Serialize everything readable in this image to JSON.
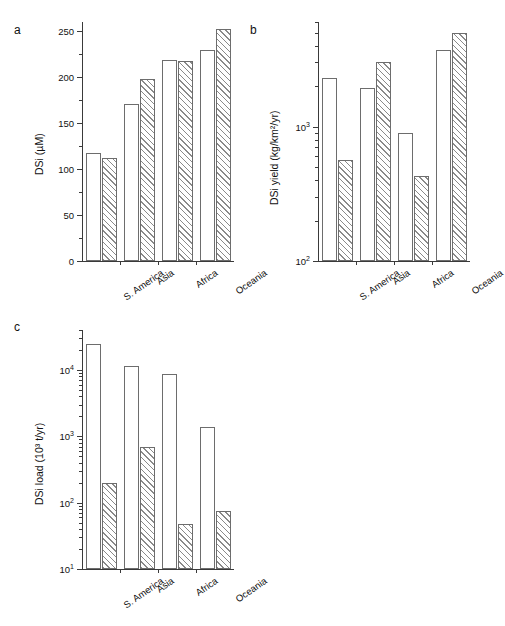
{
  "figure": {
    "categories": [
      "S. America",
      "Asia",
      "Africa",
      "Oceania"
    ],
    "series_names": [
      "open",
      "hatched"
    ],
    "panels": [
      {
        "letter": "a"
      },
      {
        "letter": "b"
      },
      {
        "letter": "c"
      }
    ]
  },
  "chart_data": [
    {
      "type": "bar",
      "panel": "a",
      "title": "",
      "xlabel": "",
      "ylabel": "DSi (µM)",
      "yscale": "linear",
      "ylim": [
        0,
        260
      ],
      "yticks": [
        0,
        50,
        100,
        150,
        200,
        250
      ],
      "yticklabels": [
        "0",
        "50",
        "100",
        "150",
        "200",
        "250"
      ],
      "categories": [
        "S. America",
        "Asia",
        "Africa",
        "Oceania"
      ],
      "grid": false,
      "legend": "none",
      "series": [
        {
          "name": "open",
          "values": [
            117,
            171,
            219,
            230
          ]
        },
        {
          "name": "hatched",
          "values": [
            112,
            198,
            218,
            252
          ]
        }
      ]
    },
    {
      "type": "bar",
      "panel": "b",
      "title": "",
      "xlabel": "",
      "ylabel": "DSi yield (kg/km²/yr)",
      "yscale": "log",
      "ylim": [
        100,
        6000
      ],
      "yticks": [
        100,
        1000
      ],
      "yticklabels": [
        "10²",
        "10³"
      ],
      "categories": [
        "S. America",
        "Asia",
        "Africa",
        "Oceania"
      ],
      "grid": false,
      "legend": "none",
      "series": [
        {
          "name": "open",
          "values": [
            2300,
            1950,
            900,
            3700
          ]
        },
        {
          "name": "hatched",
          "values": [
            560,
            3000,
            430,
            5000
          ]
        }
      ]
    },
    {
      "type": "bar",
      "panel": "c",
      "title": "",
      "xlabel": "",
      "ylabel": "DSi load (10³ t/yr)",
      "yscale": "log",
      "ylim": [
        10,
        40000
      ],
      "yticks": [
        10,
        100,
        1000,
        10000
      ],
      "yticklabels": [
        "10¹",
        "10²",
        "10³",
        "10⁴"
      ],
      "categories": [
        "S. America",
        "Asia",
        "Africa",
        "Oceania"
      ],
      "grid": false,
      "legend": "none",
      "series": [
        {
          "name": "open",
          "values": [
            25000,
            11500,
            8800,
            1400
          ]
        },
        {
          "name": "hatched",
          "values": [
            200,
            680,
            47,
            75
          ]
        }
      ]
    }
  ]
}
